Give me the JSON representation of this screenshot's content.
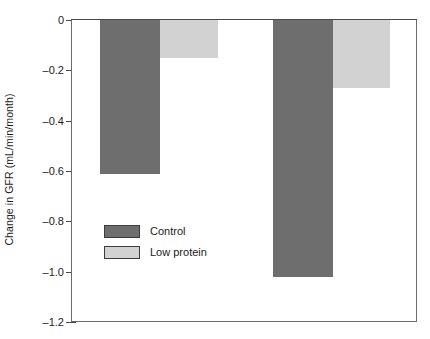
{
  "chart_data": {
    "type": "bar",
    "title": "",
    "subtitle": "",
    "xlabel": "",
    "ylabel": "Change in GFR (mL/min/month)",
    "categories": [
      "Group 1",
      "Group 2"
    ],
    "series": [
      {
        "name": "Control",
        "color": "#6e6e6e",
        "values": [
          -0.61,
          -1.02
        ]
      },
      {
        "name": "Low protein",
        "color": "#d2d2d2",
        "values": [
          -0.15,
          -0.27
        ]
      }
    ],
    "ylim": [
      -1.2,
      0
    ],
    "ytick_values": [
      0,
      -0.2,
      -0.4,
      -0.6,
      -0.8,
      -1.0,
      -1.2
    ],
    "ytick_labels": [
      "0",
      "–0.2",
      "–0.4",
      "–0.6",
      "–0.8",
      "–1.0",
      "–1.2"
    ],
    "xtick_labels": [],
    "grid": false,
    "legend_position": "inside-left-lower",
    "frame": "box",
    "zero_line": true
  },
  "axis": {
    "y_title": "Change in GFR (mL/min/month)"
  },
  "legend": {
    "items": [
      {
        "label": "Control",
        "color": "#6e6e6e"
      },
      {
        "label": "Low protein",
        "color": "#d2d2d2"
      }
    ]
  },
  "colors": {
    "control": "#6e6e6e",
    "low_protein": "#d2d2d2",
    "axis": "#4a4a4a",
    "frame": "#6b6b6b",
    "text": "#1b1b1b",
    "background": "#ffffff"
  }
}
